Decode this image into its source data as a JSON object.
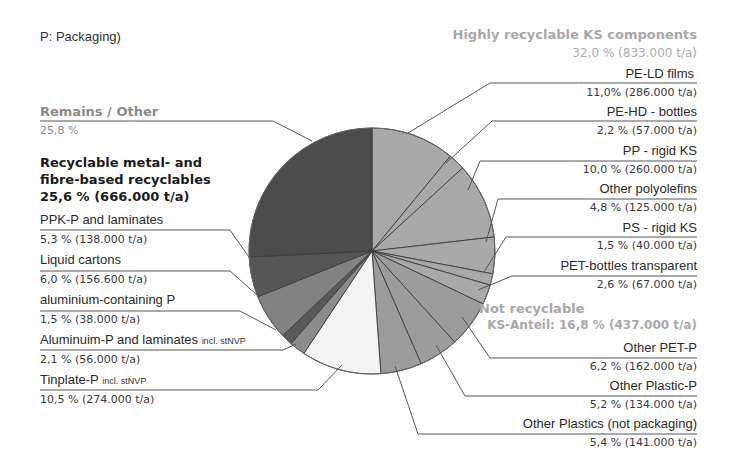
{
  "title": "P: Packaging)",
  "groups": {
    "highly_recyclable": {
      "label": "Highly recyclable KS components",
      "value": "32,0 % (833.000 t/a)"
    },
    "not_recyclable": {
      "label": "Not recyclable",
      "value": "KS-Anteil: 16,8 % (437.000 t/a)"
    },
    "remains": {
      "label": "Remains / Other",
      "value": "25,8 %"
    },
    "metal_fibre": {
      "label_line1": "Recyclable metal- and",
      "label_line2": "fibre-based recyclables",
      "value": "25,6 % (666.000 t/a)"
    }
  },
  "labels": {
    "pe_ld": {
      "name": "PE-LD films",
      "value": "11,0% (286.000 t/a)"
    },
    "pe_hd": {
      "name": "PE-HD - bottles",
      "value": "2,2 % (57.000 t/a)"
    },
    "pp": {
      "name": "PP - rigid KS",
      "value": "10,0 % (260.000 t/a)"
    },
    "other_po": {
      "name": "Other polyolefins",
      "value": "4,8 % (125.000 t/a)"
    },
    "ps": {
      "name": "PS - rigid KS",
      "value": "1,5 % (40.000 t/a)"
    },
    "pet_transp": {
      "name": "PET-bottles transparent",
      "value": "2,6 % (67.000 t/a)"
    },
    "other_pet": {
      "name": "Other PET-P",
      "value": "6,2 % (162.000 t/a)"
    },
    "other_plastic_p": {
      "name": "Other Plastic-P",
      "value": "5,2 % (134.000 t/a)"
    },
    "other_plastics": {
      "name": "Other Plastics (not packaging)",
      "value": "5,4 % (141.000 t/a)"
    },
    "tinplate": {
      "name": "Tinplate-P",
      "suffix": "incl. stNVP",
      "value": "10,5 % (274.000 t/a)"
    },
    "alu_lam": {
      "name": "Aluminuim-P and laminates",
      "suffix": "incl. stNVP",
      "value": "2,1 % (56.000 t/a)"
    },
    "alu_cont": {
      "name": "aluminium-containing P",
      "value": "1,5 % (38.000 t/a)"
    },
    "liquid": {
      "name": "Liquid cartons",
      "value": "6,0 % (156.600 t/a)"
    },
    "ppk": {
      "name": "PPK-P and laminates",
      "value": "5,3 % (138.000 t/a)"
    }
  },
  "chart_data": {
    "type": "pie",
    "title": "P: Packaging)",
    "unit": "% of total (t/a)",
    "start_angle": "12 o'clock, clockwise",
    "slices": [
      {
        "name": "PE-LD films",
        "percent": 11.0,
        "tonnes": 286000,
        "group": "Highly recyclable KS components",
        "color": "#a9a9a9"
      },
      {
        "name": "PE-HD - bottles",
        "percent": 2.2,
        "tonnes": 57000,
        "group": "Highly recyclable KS components",
        "color": "#a9a9a9"
      },
      {
        "name": "PP - rigid KS",
        "percent": 10.0,
        "tonnes": 260000,
        "group": "Highly recyclable KS components",
        "color": "#a9a9a9"
      },
      {
        "name": "Other polyolefins",
        "percent": 4.8,
        "tonnes": 125000,
        "group": "Highly recyclable KS components",
        "color": "#a9a9a9"
      },
      {
        "name": "PS - rigid KS",
        "percent": 1.5,
        "tonnes": 40000,
        "group": "Highly recyclable KS components",
        "color": "#a9a9a9"
      },
      {
        "name": "PET-bottles transparent",
        "percent": 2.6,
        "tonnes": 67000,
        "group": "Highly recyclable KS components",
        "color": "#a9a9a9"
      },
      {
        "name": "Other PET-P",
        "percent": 6.2,
        "tonnes": 162000,
        "group": "Not recyclable",
        "color": "#9c9c9c"
      },
      {
        "name": "Other Plastic-P",
        "percent": 5.2,
        "tonnes": 134000,
        "group": "Not recyclable",
        "color": "#9c9c9c"
      },
      {
        "name": "Other Plastics (not packaging)",
        "percent": 5.4,
        "tonnes": 141000,
        "group": "Not recyclable",
        "color": "#9c9c9c"
      },
      {
        "name": "Tinplate-P incl. stNVP",
        "percent": 10.5,
        "tonnes": 274000,
        "group": "Recyclable metal- and fibre-based recyclables",
        "color": "#f4f4f4"
      },
      {
        "name": "Aluminuim-P and laminates incl. stNVP",
        "percent": 2.1,
        "tonnes": 56000,
        "group": "Recyclable metal- and fibre-based recyclables",
        "color": "#8c8c8c"
      },
      {
        "name": "aluminium-containing P",
        "percent": 1.5,
        "tonnes": 38000,
        "group": "Recyclable metal- and fibre-based recyclables",
        "color": "#5a5a5a"
      },
      {
        "name": "Liquid cartons",
        "percent": 6.0,
        "tonnes": 156600,
        "group": "Recyclable metal- and fibre-based recyclables",
        "color": "#828282"
      },
      {
        "name": "PPK-P and laminates",
        "percent": 5.3,
        "tonnes": 138000,
        "group": "Recyclable metal- and fibre-based recyclables",
        "color": "#555555"
      },
      {
        "name": "Remains / Other",
        "percent": 25.8,
        "tonnes": null,
        "group": "Remains / Other",
        "color": "#4c4c4c"
      }
    ],
    "group_totals": [
      {
        "name": "Highly recyclable KS components",
        "percent": 32.0,
        "tonnes": 833000
      },
      {
        "name": "Not recyclable (KS-Anteil)",
        "percent": 16.8,
        "tonnes": 437000
      },
      {
        "name": "Recyclable metal- and fibre-based recyclables",
        "percent": 25.6,
        "tonnes": 666000
      },
      {
        "name": "Remains / Other",
        "percent": 25.8,
        "tonnes": null
      }
    ],
    "legend": "none (leader-line labels)"
  }
}
